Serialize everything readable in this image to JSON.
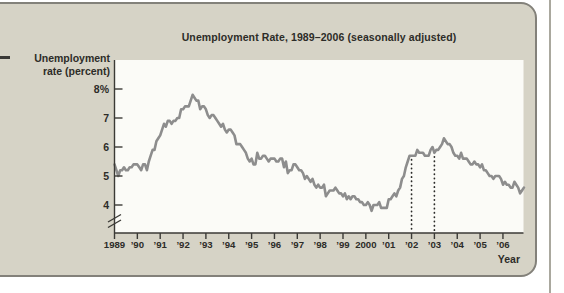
{
  "figure": {
    "ylabel_line1": "Unemployment",
    "ylabel_line2": "rate (percent)"
  },
  "colors": {
    "card_background": "#d6d3c6",
    "plot_background": "#fbfbf7",
    "curve": "#8d8d8d",
    "axis": "#3b3a36",
    "text": "#2d2c28",
    "guide_dots": "#2a2a28",
    "page_edge": "#aaa89e"
  },
  "chart_data": {
    "type": "line",
    "title": "Unemployment Rate, 1989–2006 (seasonally adjusted)",
    "xlabel": "Year",
    "ylabel": "Unemployment rate (percent)",
    "ylim_shown": [
      4,
      8
    ],
    "axis_break": true,
    "grid": false,
    "legend": "none",
    "y_tick_values": [
      8,
      7,
      6,
      5,
      4
    ],
    "y_tick_labels": [
      "8%",
      "7",
      "6",
      "5",
      "4"
    ],
    "x_start_year": 1989,
    "points_per_year": 12,
    "x_tick_labels": [
      "1989",
      "’90",
      "’91",
      "’92",
      "’93",
      "’94",
      "’95",
      "’96",
      "’97",
      "’98",
      "’99",
      "2000",
      "’01",
      "’02",
      "’03",
      "’04",
      "’05",
      "’06"
    ],
    "guide_lines_years": [
      2002,
      2003
    ],
    "series": [
      {
        "name": "Unemployment rate (percent)",
        "values": [
          5.4,
          5.2,
          5.0,
          5.2,
          5.2,
          5.3,
          5.2,
          5.2,
          5.3,
          5.3,
          5.4,
          5.4,
          5.4,
          5.3,
          5.2,
          5.4,
          5.4,
          5.2,
          5.5,
          5.7,
          5.9,
          5.9,
          6.2,
          6.3,
          6.4,
          6.6,
          6.8,
          6.7,
          6.9,
          6.9,
          6.8,
          6.9,
          6.9,
          7.0,
          7.0,
          7.3,
          7.3,
          7.4,
          7.4,
          7.4,
          7.6,
          7.8,
          7.7,
          7.6,
          7.6,
          7.3,
          7.4,
          7.4,
          7.3,
          7.1,
          7.0,
          7.1,
          7.1,
          7.0,
          6.9,
          6.8,
          6.7,
          6.8,
          6.6,
          6.5,
          6.6,
          6.6,
          6.5,
          6.4,
          6.1,
          6.1,
          6.1,
          6.0,
          5.9,
          5.8,
          5.6,
          5.5,
          5.6,
          5.4,
          5.4,
          5.8,
          5.6,
          5.6,
          5.7,
          5.7,
          5.6,
          5.5,
          5.6,
          5.6,
          5.6,
          5.5,
          5.5,
          5.6,
          5.6,
          5.3,
          5.5,
          5.1,
          5.2,
          5.2,
          5.4,
          5.4,
          5.3,
          5.2,
          5.2,
          5.1,
          4.9,
          5.0,
          4.9,
          4.8,
          4.9,
          4.7,
          4.6,
          4.7,
          4.6,
          4.6,
          4.7,
          4.3,
          4.4,
          4.5,
          4.5,
          4.5,
          4.6,
          4.5,
          4.4,
          4.4,
          4.3,
          4.4,
          4.2,
          4.3,
          4.2,
          4.3,
          4.3,
          4.2,
          4.2,
          4.1,
          4.1,
          4.0,
          4.0,
          4.1,
          4.0,
          3.8,
          4.0,
          4.0,
          4.0,
          4.1,
          3.9,
          3.9,
          3.9,
          3.9,
          4.2,
          4.2,
          4.3,
          4.4,
          4.3,
          4.5,
          4.6,
          4.9,
          5.0,
          5.3,
          5.5,
          5.7,
          5.7,
          5.7,
          5.7,
          5.9,
          5.8,
          5.8,
          5.8,
          5.7,
          5.7,
          5.7,
          5.9,
          6.0,
          5.8,
          5.9,
          5.9,
          6.0,
          6.1,
          6.3,
          6.2,
          6.1,
          6.1,
          6.0,
          5.8,
          5.7,
          5.7,
          5.6,
          5.8,
          5.6,
          5.6,
          5.6,
          5.5,
          5.4,
          5.4,
          5.5,
          5.4,
          5.4,
          5.3,
          5.4,
          5.2,
          5.2,
          5.1,
          5.0,
          5.0,
          4.9,
          5.0,
          5.0,
          5.0,
          4.9,
          4.7,
          4.8,
          4.7,
          4.7,
          4.6,
          4.6,
          4.8,
          4.7,
          4.6,
          4.4,
          4.5,
          4.6
        ]
      }
    ]
  }
}
